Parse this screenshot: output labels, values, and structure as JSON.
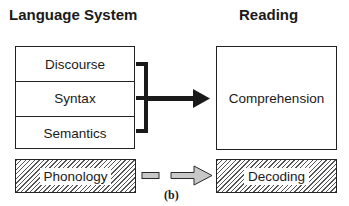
{
  "headers": {
    "language_system": "Language System",
    "reading": "Reading"
  },
  "language_system": {
    "rows": [
      {
        "label": "Discourse"
      },
      {
        "label": "Syntax"
      },
      {
        "label": "Semantics"
      }
    ],
    "phonology": "Phonology"
  },
  "reading": {
    "comprehension": "Comprehension",
    "decoding": "Decoding"
  },
  "caption": "(b)",
  "colors": {
    "line": "#1a1a1a",
    "hatch": "#555555",
    "gray_arrow_fill": "#c8c8c8"
  }
}
